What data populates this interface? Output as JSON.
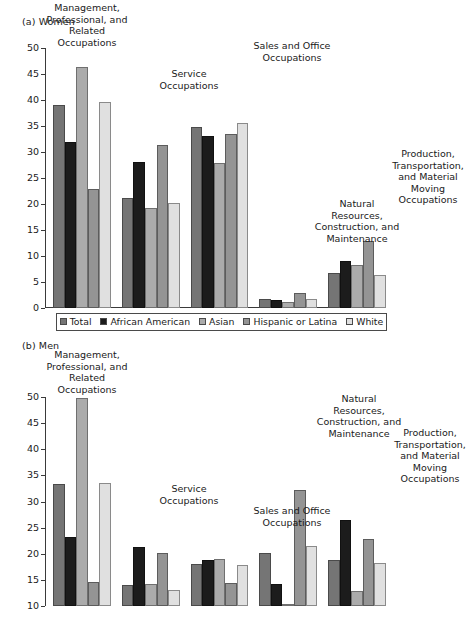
{
  "figure": {
    "panels": [
      {
        "id": "a",
        "label": "(a) Women"
      },
      {
        "id": "b",
        "label": "(b) Men"
      }
    ]
  },
  "legend": {
    "items": [
      {
        "label": "Total",
        "color": "#757575",
        "series_key": "total"
      },
      {
        "label": "African American",
        "color": "#1c1c1c",
        "series_key": "african_american"
      },
      {
        "label": "Asian",
        "color": "#ababab",
        "series_key": "asian"
      },
      {
        "label": "Hispanic or Latina",
        "color": "#949494",
        "series_key": "hispanic"
      },
      {
        "label": "White",
        "color": "#e0e0e0",
        "series_key": "white"
      }
    ]
  },
  "chart_data": [
    {
      "id": "a",
      "type": "bar",
      "title": "(a) Women",
      "xlabel": "",
      "ylabel": "",
      "ylim": [
        0,
        50
      ],
      "yticks": [
        0,
        5,
        10,
        15,
        20,
        25,
        30,
        35,
        40,
        45,
        50
      ],
      "ytick_labels": [
        "0",
        "5",
        "10",
        "15",
        "20",
        "25",
        "30",
        "35",
        "40",
        "45",
        "50"
      ],
      "grid": false,
      "legend_position": "bottom",
      "truncated": false,
      "categories": [
        "Management, Professional, and Related Occupations",
        "Service Occupations",
        "Sales and Office Occupations",
        "Natural Resources, Construction, and Maintenance",
        "Production, Transportation, and Material Moving Occupations"
      ],
      "category_labels_display": [
        "Management,\nProfessional, and\nRelated\nOccupations",
        "Service\nOccupations",
        "Sales and Office\nOccupations",
        "Natural\nResources,\nConstruction, and\nMaintenance",
        "Production,\nTransportation,\nand Material\nMoving\nOccupations"
      ],
      "series": [
        {
          "name": "Total",
          "values": [
            39.0,
            21.2,
            34.9,
            1.8,
            6.8
          ]
        },
        {
          "name": "African American",
          "values": [
            32.0,
            28.1,
            33.0,
            1.6,
            9.0
          ]
        },
        {
          "name": "Asian",
          "values": [
            46.3,
            19.3,
            27.9,
            1.2,
            8.2
          ]
        },
        {
          "name": "Hispanic or Latina",
          "values": [
            22.9,
            31.4,
            33.4,
            2.9,
            12.8
          ]
        },
        {
          "name": "White",
          "values": [
            39.6,
            20.1,
            35.5,
            1.7,
            6.4
          ]
        }
      ]
    },
    {
      "id": "b",
      "type": "bar",
      "title": "(b) Men",
      "xlabel": "",
      "ylabel": "",
      "ylim": [
        0,
        50
      ],
      "yticks": [
        10,
        15,
        20,
        25,
        30,
        35,
        40,
        45,
        50
      ],
      "ytick_labels": [
        "10",
        "15",
        "20",
        "25",
        "30",
        "35",
        "40",
        "45",
        "50"
      ],
      "grid": false,
      "legend_position": "none",
      "truncated": true,
      "truncation_note": "Panel (b) is cut off by the bottom edge of the screenshot just below the 10 tick.",
      "categories": [
        "Management, Professional, and Related Occupations",
        "Service Occupations",
        "Sales and Office Occupations",
        "Natural Resources, Construction, and Maintenance",
        "Production, Transportation, and Material Moving Occupations"
      ],
      "category_labels_display": [
        "Management,\nProfessional, and\nRelated\nOccupations",
        "Service\nOccupations",
        "Sales and Office\nOccupations",
        "Natural\nResources,\nConstruction, and\nMaintenance",
        "Production,\nTransportation,\nand Material\nMoving\nOccupations"
      ],
      "series": [
        {
          "name": "Total",
          "values": [
            33.3,
            14.0,
            18.0,
            20.2,
            18.8
          ]
        },
        {
          "name": "African American",
          "values": [
            23.2,
            21.2,
            18.9,
            14.3,
            26.5
          ]
        },
        {
          "name": "Asian",
          "values": [
            49.8,
            14.2,
            19.0,
            8.4,
            12.8
          ]
        },
        {
          "name": "Hispanic or Latina",
          "values": [
            14.6,
            20.1,
            14.4,
            32.2,
            22.9
          ]
        },
        {
          "name": "White",
          "values": [
            33.6,
            13.0,
            17.9,
            21.5,
            18.3
          ]
        }
      ]
    }
  ]
}
